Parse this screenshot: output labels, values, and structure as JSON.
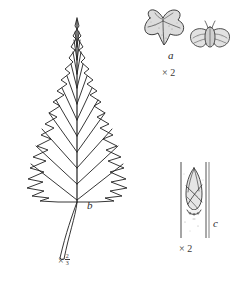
{
  "plate": {
    "title": "Birch botanical plate",
    "background_color": "#ffffff",
    "ink_color": "#1f1f1f",
    "shade_color": "#d8d8d8"
  },
  "figures": [
    {
      "key": "nutlet",
      "label": "a",
      "scale_text": "× 2",
      "scale_times": "×",
      "scale_value": "2",
      "caption_name": "winged-nutlet"
    },
    {
      "key": "leaf",
      "label": "b",
      "scale_times": "×",
      "scale_numerator": "2",
      "scale_denominator": "3",
      "scale_text": "× 2/3",
      "caption_name": "leaf"
    },
    {
      "key": "bud",
      "label": "c",
      "scale_text": "× 2",
      "scale_times": "×",
      "scale_value": "2",
      "caption_name": "bud-on-twig"
    }
  ],
  "labels": {
    "nutlet": "a",
    "leaf": "b",
    "bud": "c"
  },
  "scales": {
    "nutlet": "× 2",
    "bud": "× 2",
    "leaf_times": "×",
    "leaf_num": "2",
    "leaf_den": "3"
  },
  "icons": {
    "leaf": "leaf-blade-icon",
    "nutlet": "winged-nutlet-icon",
    "nutlet_face": "nutlet-face-view-icon",
    "bud": "bud-on-twig-icon"
  }
}
